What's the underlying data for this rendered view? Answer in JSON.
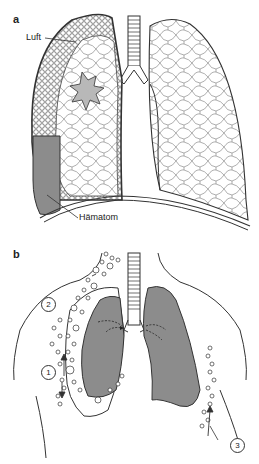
{
  "figure": {
    "panel_a": {
      "label": "a",
      "callouts": {
        "air": "Luft",
        "hematoma": "Hämatom"
      }
    },
    "panel_b": {
      "label": "b",
      "markers": [
        "1",
        "2",
        "3"
      ]
    }
  },
  "colors": {
    "outline": "#333333",
    "shaded_fill": "#8c8c8c",
    "light_fill": "#b8b8b8",
    "cell_stroke": "#666666",
    "background": "#ffffff"
  }
}
